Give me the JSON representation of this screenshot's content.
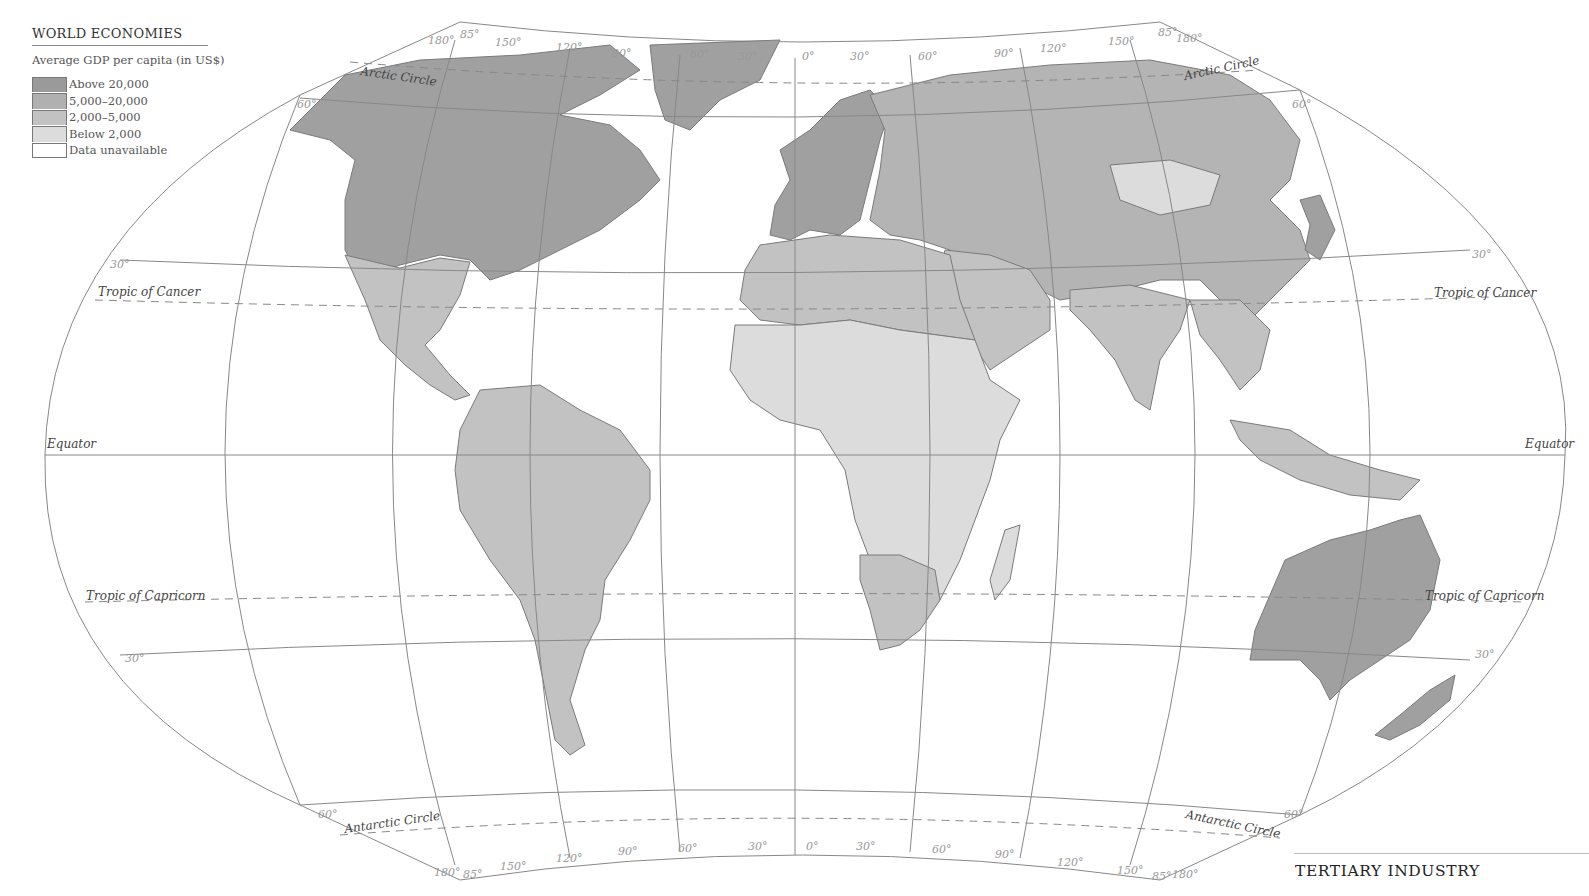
{
  "legend": {
    "title": "WORLD ECONOMIES",
    "subtitle": "Average GDP per capita (in US$)",
    "items": [
      {
        "label": "Above 20,000",
        "color": "#9a9a9a"
      },
      {
        "label": "5,000–20,000",
        "color": "#b0b0b0"
      },
      {
        "label": "2,000–5,000",
        "color": "#c2c2c2"
      },
      {
        "label": "Below 2,000",
        "color": "#dcdcdc"
      },
      {
        "label": "Data unavailable",
        "color": "#ffffff"
      }
    ]
  },
  "map": {
    "reference_lines": {
      "arctic_circle": "Arctic Circle",
      "tropic_of_cancer": "Tropic of Cancer",
      "equator": "Equator",
      "tropic_of_capricorn": "Tropic of Capricorn",
      "antarctic_circle": "Antarctic Circle"
    },
    "top_longitude_labels": [
      "180°",
      "85°",
      "150°",
      "120°",
      "90°",
      "60°",
      "30°",
      "0°",
      "30°",
      "60°",
      "90°",
      "120°",
      "150°",
      "85°",
      "180°"
    ],
    "bottom_longitude_labels": [
      "180°",
      "85°",
      "150°",
      "120°",
      "90°",
      "60°",
      "30°",
      "0°",
      "30°",
      "60°",
      "90°",
      "120°",
      "150°",
      "85°",
      "180°"
    ],
    "latitude_labels": {
      "north_60": "60°",
      "north_30": "30°",
      "south_30": "30°",
      "south_60": "60°"
    }
  },
  "section": {
    "title": "TERTIARY INDUSTRY"
  }
}
